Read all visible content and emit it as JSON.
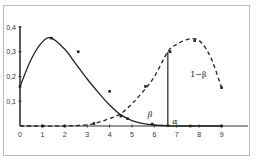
{
  "chart_data": {
    "type": "line",
    "title": "",
    "xlabel": "",
    "ylabel": "",
    "xlim": [
      0,
      10
    ],
    "ylim": [
      0,
      0.4
    ],
    "x_ticks": [
      "0",
      "1",
      "2",
      "3",
      "4",
      "5",
      "6",
      "7",
      "8",
      "9"
    ],
    "y_ticks": [
      "0,1",
      "0,2",
      "0,3",
      "0,4"
    ],
    "origin_label": "0",
    "grid": false,
    "series": [
      {
        "name": "H0 distribution",
        "style": "solid",
        "color": "#222222",
        "x": [
          0,
          0.5,
          1,
          1.4,
          2,
          2.5,
          3,
          3.5,
          4,
          4.5,
          5,
          5.5,
          6,
          6.6,
          7,
          8,
          9
        ],
        "y": [
          0.16,
          0.27,
          0.34,
          0.355,
          0.31,
          0.25,
          0.19,
          0.135,
          0.085,
          0.045,
          0.022,
          0.01,
          0.004,
          0.001,
          0.0,
          0.0,
          0.0
        ],
        "markers_x": [
          0,
          1.4,
          2.6,
          4.0,
          4.8,
          5.9,
          6.6,
          7.6,
          9
        ],
        "markers_y": [
          0.16,
          0.355,
          0.3,
          0.14,
          0.03,
          0.008,
          0.001,
          0.0,
          0.0
        ]
      },
      {
        "name": "H1 distribution",
        "style": "dashed",
        "color": "#222222",
        "x": [
          0,
          1,
          2,
          3,
          3.5,
          4,
          4.5,
          5,
          5.5,
          6,
          6.6,
          7,
          7.5,
          8,
          8.5,
          9
        ],
        "y": [
          0.0,
          0.0,
          0.0,
          0.005,
          0.015,
          0.03,
          0.05,
          0.09,
          0.14,
          0.2,
          0.3,
          0.33,
          0.35,
          0.345,
          0.28,
          0.155
        ],
        "markers_x": [
          1,
          2,
          3.3,
          4.5,
          5.6,
          6.7,
          7.8,
          9
        ],
        "markers_y": [
          0.0,
          0.0,
          0.01,
          0.04,
          0.16,
          0.3,
          0.345,
          0.155
        ]
      }
    ],
    "critical_value_x": 6.6,
    "annotations": [
      {
        "text": "1−β",
        "x": 7.6,
        "y": 0.2
      },
      {
        "text": "β",
        "x": 5.7,
        "y": 0.035
      },
      {
        "text": "α",
        "x": 6.8,
        "y": 0.01
      }
    ]
  }
}
